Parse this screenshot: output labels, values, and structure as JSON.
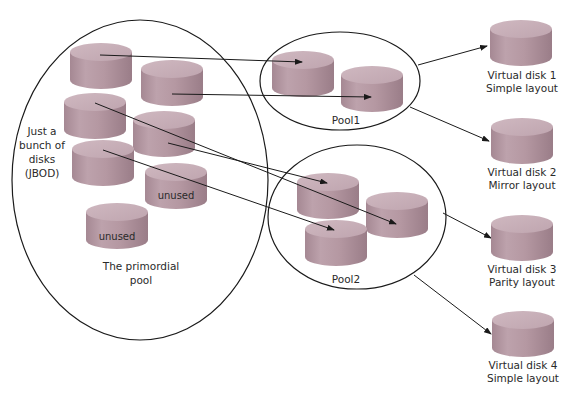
{
  "diagram": {
    "primordial_pool": {
      "label_line1": "The primordial",
      "label_line2": "pool",
      "jbod_label": [
        "Just a",
        "bunch of",
        "disks",
        "(JBOD)"
      ],
      "unused_labels": [
        "unused",
        "unused"
      ]
    },
    "pool1": {
      "label": "Pool1"
    },
    "pool2": {
      "label": "Pool2"
    },
    "virtual_disks": [
      {
        "name": "Virtual disk 1",
        "layout": "Simple layout"
      },
      {
        "name": "Virtual disk 2",
        "layout": "Mirror layout"
      },
      {
        "name": "Virtual disk 3",
        "layout": "Parity layout"
      },
      {
        "name": "Virtual disk 4",
        "layout": "Simple layout"
      }
    ],
    "colors": {
      "disk_top": "#c9b1b9",
      "disk_side": "#b0949e",
      "disk_side_dark": "#9c7f89",
      "line": "#1a1a1a"
    }
  }
}
